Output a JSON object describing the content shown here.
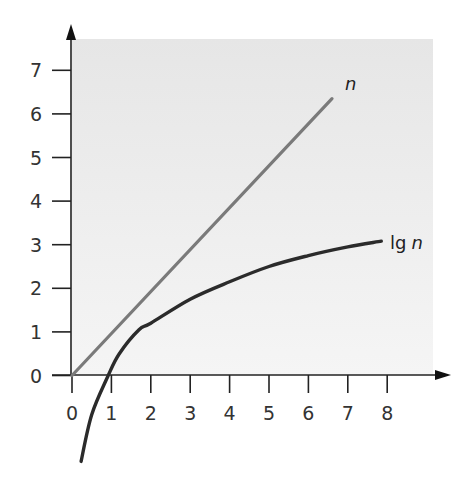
{
  "chart_data": {
    "type": "line",
    "title": "",
    "xlabel": "",
    "ylabel": "",
    "xlim": [
      0,
      9
    ],
    "ylim": [
      -2,
      7.8
    ],
    "x_ticks": [
      0,
      1,
      2,
      3,
      4,
      5,
      6,
      7,
      8
    ],
    "y_ticks": [
      0,
      1,
      2,
      3,
      4,
      5,
      6,
      7
    ],
    "x_tick_labels": [
      "0",
      "1",
      "2",
      "3",
      "4",
      "5",
      "6",
      "7",
      "8"
    ],
    "y_tick_labels": [
      "0",
      "1",
      "2",
      "3",
      "4",
      "5",
      "6",
      "7"
    ],
    "grid": false,
    "legend": "inline labels at line ends",
    "background": "light gray shaded plot area",
    "series": [
      {
        "name": "n",
        "label_main": "n",
        "label_italic": true,
        "color": "#7a7a7a",
        "x": [
          0,
          6.6
        ],
        "y": [
          0,
          6.35
        ]
      },
      {
        "name": "lg n",
        "label_main": "lg",
        "label_var": "n",
        "color": "#2b2b2b",
        "x": [
          0.23,
          0.5,
          0.92,
          1.2,
          1.7,
          2.0,
          3.0,
          4.0,
          5.0,
          6.0,
          7.0,
          7.85
        ],
        "y": [
          -1.97,
          -0.9,
          0.0,
          0.5,
          1.05,
          1.2,
          1.75,
          2.15,
          2.5,
          2.75,
          2.95,
          3.08
        ]
      }
    ]
  }
}
